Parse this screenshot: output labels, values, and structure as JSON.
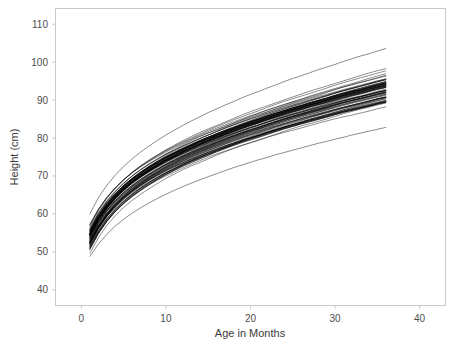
{
  "chart_data": {
    "type": "line",
    "title": "",
    "xlabel": "Age in Months",
    "ylabel": "Height (cm)",
    "xlim": [
      -3,
      43
    ],
    "ylim": [
      36,
      114
    ],
    "xticks": [
      0,
      10,
      20,
      30,
      40
    ],
    "yticks": [
      40,
      50,
      60,
      70,
      80,
      90,
      100,
      110
    ],
    "xtick_labels": [
      "0",
      "10",
      "20",
      "30",
      "40"
    ],
    "ytick_labels": [
      "40",
      "50",
      "60",
      "70",
      "80",
      "90",
      "100",
      "110"
    ],
    "grid": false,
    "legend": null,
    "line_color": "#000000",
    "line_width": 0.45,
    "axis_color": "#c8c8c8",
    "background": "#ffffff",
    "x_start": 1,
    "x_end": 36,
    "n_series": 70,
    "series_band": {
      "start_height_min": 48.5,
      "start_height_max": 60.0,
      "end_height_min": 85.0,
      "end_height_max": 105.0,
      "dense_end_min": 88.0,
      "dense_end_max": 102.0
    },
    "x": [
      1,
      2,
      3,
      4,
      5,
      6,
      7,
      8,
      9,
      10,
      11,
      12,
      13,
      14,
      15,
      16,
      17,
      18,
      19,
      20,
      21,
      22,
      23,
      24,
      25,
      26,
      27,
      28,
      29,
      30,
      31,
      32,
      33,
      34,
      35,
      36
    ],
    "series": [
      {
        "name": "child-median",
        "values": [
          54.0,
          58.1,
          61.3,
          63.9,
          66.1,
          68.0,
          69.6,
          71.1,
          72.4,
          73.7,
          74.8,
          75.9,
          76.9,
          77.9,
          78.8,
          79.7,
          80.6,
          81.4,
          82.2,
          83.0,
          83.7,
          84.5,
          85.2,
          85.9,
          86.6,
          87.2,
          87.9,
          88.5,
          89.1,
          89.8,
          90.4,
          91.0,
          91.5,
          92.1,
          92.7,
          93.2
        ]
      },
      {
        "name": "band-upper",
        "values": [
          58.5,
          62.5,
          65.8,
          68.4,
          70.6,
          72.5,
          74.2,
          75.7,
          77.1,
          78.4,
          79.6,
          80.7,
          81.8,
          82.8,
          83.8,
          84.7,
          85.6,
          86.5,
          87.4,
          88.2,
          89.0,
          89.8,
          90.6,
          91.4,
          92.1,
          92.8,
          93.5,
          94.2,
          94.9,
          95.6,
          96.3,
          96.9,
          97.6,
          98.2,
          98.8,
          99.4
        ]
      },
      {
        "name": "band-lower",
        "values": [
          49.5,
          53.4,
          56.5,
          59.0,
          61.1,
          62.9,
          64.5,
          65.9,
          67.2,
          68.4,
          69.5,
          70.6,
          71.6,
          72.5,
          73.4,
          74.3,
          75.1,
          75.9,
          76.7,
          77.4,
          78.1,
          78.8,
          79.5,
          80.2,
          80.8,
          81.5,
          82.1,
          82.7,
          83.3,
          83.9,
          84.5,
          85.0,
          85.6,
          86.1,
          86.7,
          87.2
        ]
      },
      {
        "name": "outlier-low",
        "values": [
          48.8,
          52.0,
          54.6,
          56.8,
          58.6,
          60.2,
          61.6,
          62.9,
          64.1,
          65.2,
          66.2,
          67.2,
          68.1,
          69.0,
          69.8,
          70.6,
          71.4,
          72.2,
          72.9,
          73.6,
          74.3,
          74.9,
          75.6,
          76.2,
          76.8,
          77.4,
          78.0,
          78.6,
          79.1,
          79.7,
          80.2,
          80.8,
          81.3,
          81.8,
          82.3,
          82.8
        ]
      },
      {
        "name": "outlier-high",
        "values": [
          60.0,
          64.2,
          67.5,
          70.2,
          72.5,
          74.5,
          76.3,
          77.9,
          79.4,
          80.8,
          82.1,
          83.3,
          84.5,
          85.6,
          86.7,
          87.7,
          88.7,
          89.6,
          90.6,
          91.5,
          92.3,
          93.2,
          94.0,
          94.9,
          95.7,
          96.4,
          97.2,
          98.0,
          98.7,
          99.4,
          100.2,
          100.9,
          101.6,
          102.2,
          102.9,
          103.6
        ]
      }
    ]
  }
}
